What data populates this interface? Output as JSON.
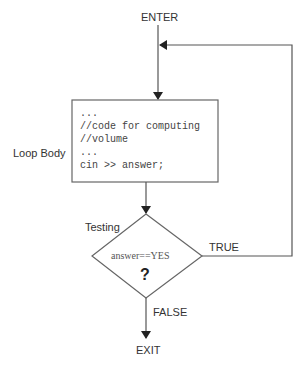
{
  "diagram": {
    "type": "flowchart",
    "nodes": {
      "enter": {
        "label": "ENTER"
      },
      "loop_body": {
        "label": "Loop Body",
        "code_lines": [
          "...",
          "//code for computing",
          "//volume",
          "...",
          "cin >> answer;"
        ]
      },
      "testing": {
        "label": "Testing",
        "condition": "answer==YES",
        "symbol": "?"
      },
      "exit": {
        "label": "EXIT"
      }
    },
    "edges": {
      "true_label": "TRUE",
      "false_label": "FALSE"
    },
    "colors": {
      "line": "#555555",
      "text": "#333333",
      "background": "#ffffff"
    }
  }
}
